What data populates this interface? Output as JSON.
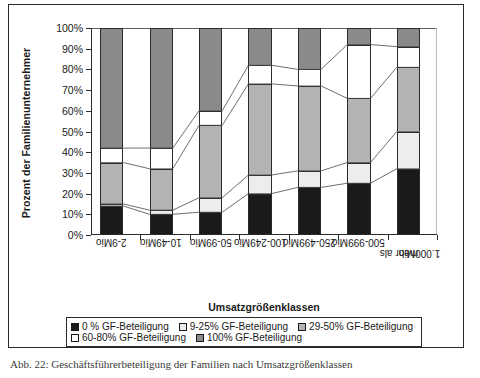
{
  "figure": {
    "y_axis_title": "Prozent der Familienunternehmer",
    "x_axis_title": "Umsatzgrößenklassen",
    "caption": "Abb. 22: Geschäftsführerbeteiligung der Familien nach Umsatzgrößenklassen"
  },
  "colors": {
    "series_0": "#1a1a1a",
    "series_9_25": "#ededed",
    "series_29_50": "#b3b3b3",
    "series_60_80": "#ffffff",
    "series_100": "#8a8a8a",
    "axis": "#2b2b2b",
    "connector": "#4a4a4a"
  },
  "chart_data": {
    "type": "bar",
    "subtype": "stacked-100-percent-with-connectors",
    "title": "",
    "xlabel": "Umsatzgrößenklassen",
    "ylabel": "Prozent der Familienunternehmer",
    "ylim": [
      0,
      100
    ],
    "yticks": [
      0,
      10,
      20,
      30,
      40,
      50,
      60,
      70,
      80,
      90,
      100
    ],
    "ytick_labels": [
      "0%",
      "10%",
      "20%",
      "30%",
      "40%",
      "50%",
      "60%",
      "70%",
      "80%",
      "90%",
      "100%"
    ],
    "grid": false,
    "legend_position": "bottom",
    "categories": [
      "2-9Mio",
      "10-49Mio",
      "50-99Mio",
      "100-249Mio",
      "250-499Mio",
      "500-999Mio",
      "mehr als\n1.000Mio"
    ],
    "category_labels_display": [
      [
        "2-9Mio"
      ],
      [
        "10-49Mio"
      ],
      [
        "50-99Mio"
      ],
      [
        "100-249Mio"
      ],
      [
        "250-499Mio"
      ],
      [
        "500-999Mio"
      ],
      [
        "mehr als",
        "1.000Mio"
      ]
    ],
    "series": [
      {
        "name": "0 % GF-Beteiligung",
        "key": "series_0",
        "values": [
          14,
          10,
          11,
          20,
          23,
          25,
          32
        ]
      },
      {
        "name": "9-25% GF-Beteiligung",
        "key": "series_9_25",
        "values": [
          1,
          2,
          7,
          9,
          8,
          10,
          18
        ]
      },
      {
        "name": "29-50% GF-Beteiligung",
        "key": "series_29_50",
        "values": [
          20,
          20,
          35,
          44,
          41,
          31,
          31
        ]
      },
      {
        "name": "60-80% GF-Beteiligung",
        "key": "series_60_80",
        "values": [
          7,
          10,
          7,
          9,
          8,
          26,
          10
        ]
      },
      {
        "name": "100% GF-Beteiligung",
        "key": "series_100",
        "values": [
          58,
          58,
          40,
          18,
          20,
          8,
          9
        ]
      }
    ],
    "cumulative_boundaries": [
      [
        14,
        15,
        35,
        42,
        100
      ],
      [
        10,
        12,
        32,
        42,
        100
      ],
      [
        11,
        18,
        53,
        60,
        100
      ],
      [
        20,
        29,
        73,
        82,
        100
      ],
      [
        23,
        31,
        72,
        80,
        100
      ],
      [
        25,
        35,
        66,
        92,
        100
      ],
      [
        32,
        50,
        81,
        91,
        100
      ]
    ]
  },
  "legend": {
    "row1": [
      {
        "label": "0 % GF-Beteiligung",
        "key": "series_0"
      },
      {
        "label": "9-25% GF-Beteiligung",
        "key": "series_9_25"
      },
      {
        "label": "29-50% GF-Beteiligung",
        "key": "series_29_50"
      }
    ],
    "row2": [
      {
        "label": "60-80% GF-Beteiligung",
        "key": "series_60_80"
      },
      {
        "label": "100% GF-Beteiligung",
        "key": "series_100"
      }
    ]
  }
}
